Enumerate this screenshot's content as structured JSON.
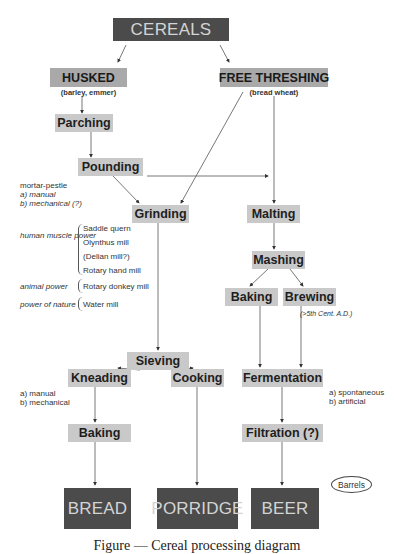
{
  "diagram": {
    "title_node": "CEREALS",
    "nodes": {
      "cereals": "CEREALS",
      "husked": "HUSKED",
      "husked_sub": "(barley, emmer)",
      "free_threshing": "FREE THRESHING",
      "free_threshing_sub": "(bread wheat)",
      "parching": "Parching",
      "pounding": "Pounding",
      "grinding": "Grinding",
      "malting": "Malting",
      "mashing": "Mashing",
      "baking_beer": "Baking",
      "brewing": "Brewing",
      "brewing_sub": "(>5th Cent. A.D.)",
      "sieving": "Sieving",
      "kneading": "Kneading",
      "cooking": "Cooking",
      "fermentation": "Fermentation",
      "baking_bread": "Baking",
      "filtration": "Filtration (?)",
      "bread": "BREAD",
      "porridge": "PORRIDGE",
      "beer": "BEER"
    },
    "annotations": {
      "pounding_method": [
        "mortar-pestle",
        "a) manual",
        "b) mechanical (?)"
      ],
      "power_human": "human muscle power",
      "mills_human": [
        "Saddle quern",
        "Olynthus mill",
        "(Delian mill?)",
        "Rotary hand mill"
      ],
      "power_animal": "animal power",
      "mills_animal": [
        "Rotary donkey mill"
      ],
      "power_nature": "power of nature",
      "mills_nature": [
        "Water mill"
      ],
      "kneading_method": [
        "a) manual",
        "b) mechanical"
      ],
      "fermentation_method": [
        "a) spontaneous",
        "b) artificial"
      ],
      "barrels": "Barrels"
    },
    "edges": [
      [
        "cereals",
        "husked"
      ],
      [
        "cereals",
        "free_threshing"
      ],
      [
        "husked",
        "parching"
      ],
      [
        "parching",
        "pounding"
      ],
      [
        "pounding",
        "grinding"
      ],
      [
        "pounding",
        "malting"
      ],
      [
        "free_threshing",
        "grinding"
      ],
      [
        "free_threshing",
        "malting"
      ],
      [
        "grinding",
        "sieving"
      ],
      [
        "malting",
        "mashing"
      ],
      [
        "mashing",
        "baking_beer"
      ],
      [
        "mashing",
        "brewing"
      ],
      [
        "sieving",
        "kneading"
      ],
      [
        "sieving",
        "cooking"
      ],
      [
        "baking_beer",
        "fermentation"
      ],
      [
        "brewing",
        "fermentation"
      ],
      [
        "kneading",
        "baking_bread"
      ],
      [
        "fermentation",
        "filtration"
      ],
      [
        "baking_bread",
        "bread"
      ],
      [
        "cooking",
        "porridge"
      ],
      [
        "filtration",
        "beer"
      ]
    ],
    "colors": {
      "terminal_box": "#4b4b4b",
      "category_box": "#a9a9a9",
      "process_box": "#c9c9c9"
    },
    "caption": "Figure — Cereal processing diagram"
  }
}
